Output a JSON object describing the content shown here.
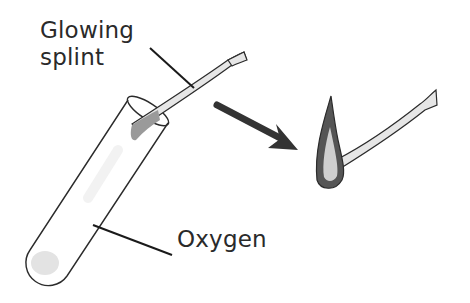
{
  "diagram": {
    "labels": {
      "glowing": "Glowing",
      "splint": "splint",
      "oxygen": "Oxygen"
    },
    "elements": [
      {
        "name": "test-tube",
        "description": "Slanted test tube containing oxygen"
      },
      {
        "name": "glowing-splint",
        "description": "Wooden splint with glowing tip inserted into tube"
      },
      {
        "name": "arrow",
        "description": "Dark arrow pointing right-down to result"
      },
      {
        "name": "relit-splint",
        "description": "Splint bursting into flame"
      }
    ],
    "colors": {
      "outline": "#2b2b2b",
      "splint_fill": "#e6e6e6",
      "glow_tip": "#9a9a9a",
      "flame_outer": "#555555",
      "flame_inner": "#cfcfcf",
      "arrow": "#333333",
      "tube_residue": "#e3e3e3"
    }
  }
}
